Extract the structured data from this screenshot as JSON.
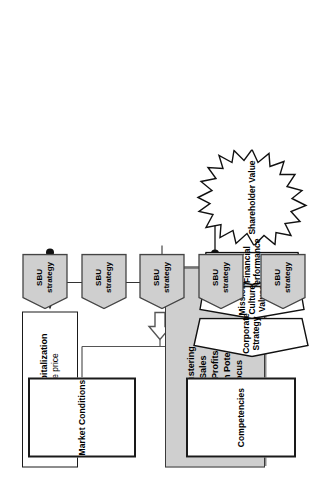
{
  "diagram": {
    "colors": {
      "criteria_box_fill": "#cfcfcf",
      "sbu_fill": "#cfcfcf",
      "stroke": "#1a1a1a",
      "background": "#ffffff"
    }
  },
  "market_capitalization": {
    "bullet": "Market Capitalization",
    "sub": "– Share price",
    "bullet_glyph": "●"
  },
  "criteria": {
    "bullet_glyph": "●",
    "items": [
      "Tightness of Clustering",
      "Contribution to Sales",
      "Contribution to Profits",
      "Segment Growth Potential",
      "Geographical Focus"
    ]
  },
  "shareholder_value": {
    "label": "Shareholder Value"
  },
  "chevrons": [
    {
      "label": "Financial Performance"
    },
    {
      "label": "Mission, Culture, Values"
    },
    {
      "label": "Corporate Strategy"
    }
  ],
  "sbu_units": [
    {
      "line1": "SBU",
      "line2": "strategy"
    },
    {
      "line1": "SBU",
      "line2": "strategy"
    },
    {
      "line1": "SBU",
      "line2": "strategy"
    },
    {
      "line1": "SBU",
      "line2": "strategy"
    },
    {
      "line1": "SBU",
      "line2": "strategy"
    }
  ],
  "inputs": [
    {
      "label": "Market Conditions"
    },
    {
      "label": "Competencies"
    }
  ]
}
